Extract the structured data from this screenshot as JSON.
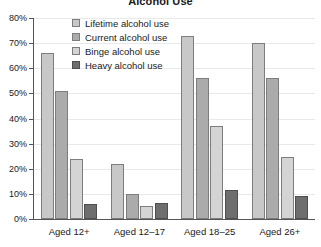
{
  "chart_data": {
    "type": "bar",
    "title": "Alcohol Use",
    "xlabel": "",
    "ylabel": "",
    "ylim": [
      0,
      80
    ],
    "ytick_labels": [
      "0%",
      "10%",
      "20%",
      "30%",
      "40%",
      "50%",
      "60%",
      "70%",
      "80%"
    ],
    "ytick_values": [
      0,
      10,
      20,
      30,
      40,
      50,
      60,
      70,
      80
    ],
    "grid": true,
    "legend_position": "upper-left-inside",
    "categories": [
      "Aged 12+",
      "Aged 12–17",
      "Aged 18–25",
      "Aged 26+"
    ],
    "series": [
      {
        "name": "Lifetime alcohol use",
        "color": "#c8c8c8",
        "values": [
          66,
          22,
          73,
          70
        ]
      },
      {
        "name": "Current alcohol use",
        "color": "#ababab",
        "values": [
          51,
          10,
          56,
          56
        ]
      },
      {
        "name": "Binge alcohol use",
        "color": "#d4d4d4",
        "values": [
          24,
          5,
          37,
          24.5
        ]
      },
      {
        "name": "Heavy alcohol use",
        "color": "#6e6e6e",
        "values": [
          6,
          6.5,
          11.5,
          9
        ]
      }
    ]
  }
}
